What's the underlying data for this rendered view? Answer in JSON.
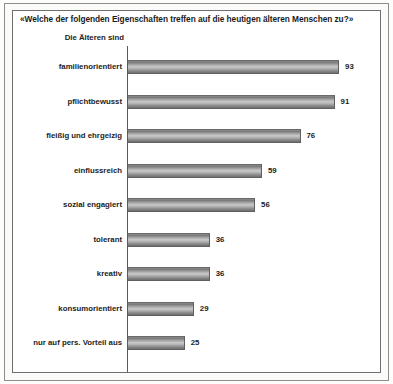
{
  "chart_data": {
    "type": "bar",
    "orientation": "horizontal",
    "title": "«Welche der folgenden Eigenschaften treffen auf die heutigen älteren Menschen zu?»",
    "axis_header": "Die Älteren sind",
    "xlabel": "",
    "ylabel": "",
    "xlim": [
      0,
      100
    ],
    "grid": false,
    "legend": null,
    "categories": [
      "familienorientiert",
      "pflichtbewusst",
      "fleißig und ehrgeizig",
      "einflussreich",
      "sozial engagiert",
      "tolerant",
      "kreativ",
      "konsumorientiert",
      "nur auf pers. Vorteil aus"
    ],
    "values": [
      93,
      91,
      76,
      59,
      56,
      36,
      36,
      29,
      25
    ],
    "bars": [
      {
        "label": "familienorientiert",
        "value": 93,
        "value_text": "93"
      },
      {
        "label": "pflichtbewusst",
        "value": 91,
        "value_text": "91"
      },
      {
        "label": "fleißig und ehrgeizig",
        "value": 76,
        "value_text": "76"
      },
      {
        "label": "einflussreich",
        "value": 59,
        "value_text": "59"
      },
      {
        "label": "sozial engagiert",
        "value": 56,
        "value_text": "56"
      },
      {
        "label": "tolerant",
        "value": 36,
        "value_text": "36"
      },
      {
        "label": "kreativ",
        "value": 36,
        "value_text": "36"
      },
      {
        "label": "konsumorientiert",
        "value": 29,
        "value_text": "29"
      },
      {
        "label": "nur auf pers. Vorteil aus",
        "value": 25,
        "value_text": "25"
      }
    ]
  },
  "style": {
    "bar_fill_light": "#c9c9c9",
    "bar_fill_dark": "#6e6e6e",
    "axis_color": "#5a5a5a",
    "frame_color": "#6f6f6f",
    "background": "#ffffff",
    "text_color": "#1c1c1c"
  },
  "layout": {
    "axis_x": 128,
    "first_row_y": 59,
    "row_pitch": 34.5,
    "px_per_unit": 2.27
  }
}
